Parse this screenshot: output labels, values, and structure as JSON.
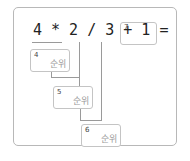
{
  "expression": {
    "text": "4 * 2 / 3 + 1 =",
    "answer_box": {
      "value": "7"
    }
  },
  "rank_boxes": [
    {
      "order": "4",
      "label": "순위"
    },
    {
      "order": "5",
      "label": "순위"
    },
    {
      "order": "6",
      "label": "순위"
    }
  ],
  "colors": {
    "frame_border": "#b8b8b8",
    "box_border": "#c4c4c4",
    "line": "#9a9a9a",
    "text": "#222222",
    "label": "#9a9a9a"
  }
}
